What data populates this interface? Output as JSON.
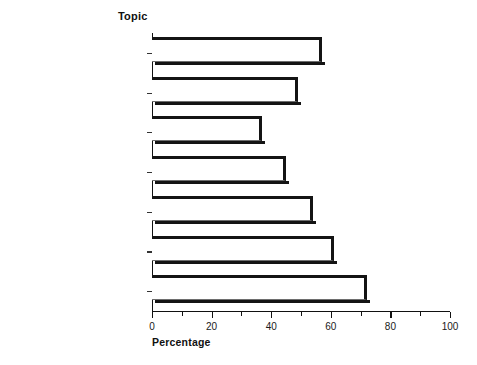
{
  "figure": {
    "category_axis_title": "Topic",
    "value_axis_title": "Percentage"
  },
  "chart_data": {
    "type": "bar",
    "orientation": "horizontal",
    "title": "",
    "xlabel": "Percentage",
    "ylabel": "Topic",
    "xlim": [
      0,
      100
    ],
    "grid": false,
    "legend": null,
    "xticks": [
      0,
      20,
      40,
      60,
      80,
      100
    ],
    "xtick_labels": [
      "0",
      "20",
      "40",
      "60",
      "80",
      "100"
    ],
    "xminor_ticks": [
      10,
      30,
      50,
      70,
      90
    ],
    "categories": [
      "Palliative Care a for Chronic Illness",
      "Palliative Care a for Terminal Illness",
      "Interdisciplinary Health Care for End of Life b",
      "Symptom Management c for Terminal Illness",
      "Symptom Management c for Chronic Illness",
      "Pain Management for Terminal and Chronic Illness",
      "Depression Identification and Treatment"
    ],
    "category_labels": [
      {
        "line1": "Palliative Care",
        "sup1": "a",
        "line1_tail": " for",
        "line2": "Chronic Illness",
        "sup2": ""
      },
      {
        "line1": "Palliative Care",
        "sup1": "a",
        "line1_tail": " for",
        "line2": "Terminal Illness",
        "sup2": ""
      },
      {
        "line1": "Interdisciplinary Health",
        "sup1": "",
        "line1_tail": "",
        "line2": "Care for End of Life",
        "sup2": "b"
      },
      {
        "line1": "Symptom Management",
        "sup1": "c",
        "line1_tail": "",
        "line2": "for Terminal Illness",
        "sup2": ""
      },
      {
        "line1": "Symptom Management",
        "sup1": "c",
        "line1_tail": "",
        "line2": "for Chronic Illness",
        "sup2": ""
      },
      {
        "line1": "Pain Management for",
        "sup1": "",
        "line1_tail": "",
        "line2": "Terminal and Chronic Illness",
        "sup2": ""
      },
      {
        "line1": "Depression Identification",
        "sup1": "",
        "line1_tail": "",
        "line2": "and Treatment",
        "sup2": ""
      }
    ],
    "values": [
      57,
      49,
      37,
      45,
      54,
      61,
      72
    ],
    "colors": {
      "bar_fill": "#ffffff",
      "bar_edge": "#141414",
      "axis": "#111111",
      "text": "#1a1a1a"
    }
  }
}
